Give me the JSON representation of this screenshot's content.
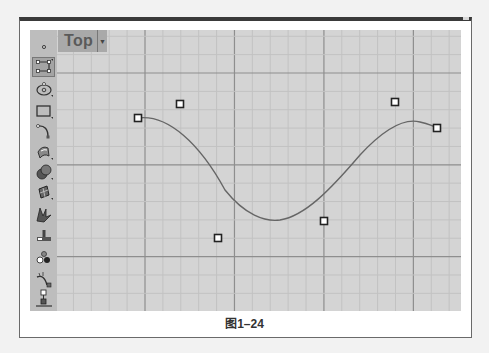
{
  "viewport": {
    "name": "Top",
    "dropdown_icon": "chevron-down-icon",
    "background": "#d4d4d4",
    "grid": {
      "minor_spacing": 18,
      "major_every": 5,
      "minor_color": "#c2c2c2",
      "major_color": "#8e8e8e"
    },
    "curve": {
      "color": "#666666",
      "control_points": [
        {
          "x": 138,
          "y": 118
        },
        {
          "x": 180,
          "y": 104
        },
        {
          "x": 218,
          "y": 238
        },
        {
          "x": 324,
          "y": 221
        },
        {
          "x": 395,
          "y": 102
        },
        {
          "x": 437,
          "y": 128
        }
      ]
    }
  },
  "toolbar": {
    "tools": [
      {
        "name": "point-icon",
        "active": false
      },
      {
        "name": "curve-from-control-points-icon",
        "active": true
      },
      {
        "name": "circle-icon",
        "active": false
      },
      {
        "name": "rectangle-icon",
        "active": false
      },
      {
        "name": "polyline-curve-icon",
        "active": false
      },
      {
        "name": "surface-icon",
        "active": false
      },
      {
        "name": "solid-spheres-icon",
        "active": false
      },
      {
        "name": "mesh-icon",
        "active": false
      },
      {
        "name": "transform-icon",
        "active": false
      },
      {
        "name": "dimension-icon",
        "active": false
      },
      {
        "name": "group-icon",
        "active": false
      },
      {
        "name": "curve-analysis-icon",
        "active": false
      },
      {
        "name": "gumball-icon",
        "active": false
      }
    ]
  },
  "caption": "图1–24"
}
